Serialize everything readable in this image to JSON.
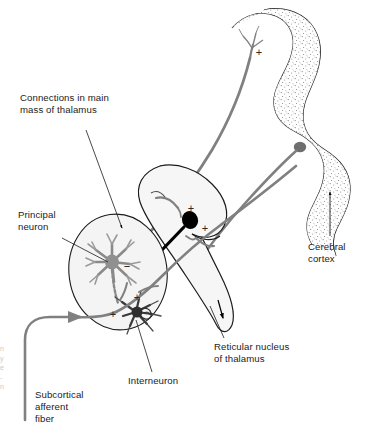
{
  "figure": {
    "labels": {
      "connections": "Connections in main\nmass of thalamus",
      "principal_neuron": "Principal\nneuron",
      "subcortical_afferent": "Subcortical\nafferent\nfiber",
      "interneuron": "Interneuron",
      "reticular_nucleus": "Reticular nucleus\nof thalamus",
      "cerebral_cortex": "Cerebral\ncortex"
    },
    "signs": {
      "inhibitory": "−",
      "excitatory": "+"
    },
    "sign_markers": [
      {
        "symbol": "+",
        "x": 259,
        "y": 52,
        "where": "cerebral-cortex-terminal"
      },
      {
        "symbol": "+",
        "x": 191,
        "y": 208,
        "where": "reticular-nucleus-upper"
      },
      {
        "symbol": "+",
        "x": 204,
        "y": 228,
        "where": "reticular-nucleus-lower"
      },
      {
        "symbol": "−",
        "x": 127,
        "y": 267,
        "where": "principal-neuron-soma"
      },
      {
        "symbol": "+",
        "x": 137,
        "y": 297,
        "where": "interneuron-upper"
      },
      {
        "symbol": "+",
        "x": 113,
        "y": 314,
        "where": "interneuron-lower"
      }
    ],
    "colors": {
      "background": "#ffffff",
      "outline": "#000000",
      "fiber_gray": "#808080",
      "nucleus_fill": "#f4f4f4",
      "cortex_stipple": "#6e6e6e",
      "soma_black": "#000000",
      "soma_gray": "#6e6e6e",
      "text": "#1b1b1b"
    },
    "marginalia": "n\ny\ne\n-\nn"
  }
}
